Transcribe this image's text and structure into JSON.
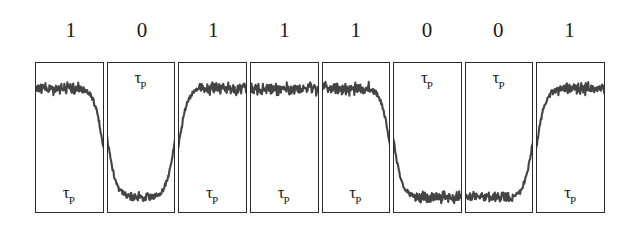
{
  "figure": {
    "bit_sequence_label": "1 0 1 1 1 0 0 1",
    "trace_color": "#444444",
    "box_border_color": "#2b2b2b",
    "background_color": "#ffffff",
    "tau_symbol": "τ",
    "tau_subscript": "P"
  },
  "bits": [
    {
      "index": 0,
      "label": "1",
      "value": 1,
      "tau_label_position": "bottom"
    },
    {
      "index": 1,
      "label": "0",
      "value": 0,
      "tau_label_position": "top"
    },
    {
      "index": 2,
      "label": "1",
      "value": 1,
      "tau_label_position": "bottom"
    },
    {
      "index": 3,
      "label": "1",
      "value": 1,
      "tau_label_position": "bottom"
    },
    {
      "index": 4,
      "label": "1",
      "value": 1,
      "tau_label_position": "bottom"
    },
    {
      "index": 5,
      "label": "0",
      "value": 0,
      "tau_label_position": "top"
    },
    {
      "index": 6,
      "label": "0",
      "value": 0,
      "tau_label_position": "top"
    },
    {
      "index": 7,
      "label": "1",
      "value": 1,
      "tau_label_position": "bottom"
    }
  ],
  "chart_data": {
    "type": "line",
    "subtitle": "",
    "xlabel": "",
    "ylabel": "",
    "grid": false,
    "legend_position": "none",
    "x": [
      0,
      1,
      2,
      3,
      4,
      5,
      6,
      7
    ],
    "categories": [
      "1",
      "0",
      "1",
      "1",
      "1",
      "0",
      "0",
      "1"
    ],
    "series": [
      {
        "name": "Detected signal amplitude",
        "values": [
          1,
          0,
          1,
          1,
          1,
          0,
          0,
          1
        ]
      }
    ],
    "annotations": [
      {
        "bit_index": 0,
        "text": "τP",
        "position": "bottom-center"
      },
      {
        "bit_index": 1,
        "text": "τP",
        "position": "top-center"
      },
      {
        "bit_index": 2,
        "text": "τP",
        "position": "bottom-center"
      },
      {
        "bit_index": 3,
        "text": "τP",
        "position": "bottom-center"
      },
      {
        "bit_index": 4,
        "text": "τP",
        "position": "bottom-center"
      },
      {
        "bit_index": 5,
        "text": "τP",
        "position": "top-center"
      },
      {
        "bit_index": 6,
        "text": "τP",
        "position": "top-center"
      },
      {
        "bit_index": 7,
        "text": "τP",
        "position": "bottom-center"
      }
    ],
    "ylim": [
      0,
      1
    ]
  }
}
